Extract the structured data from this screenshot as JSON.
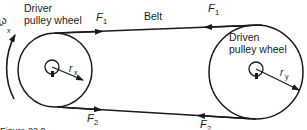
{
  "diagram": {
    "driver": {
      "label_line1": "Driver",
      "label_line2": "pulley wheel",
      "radius_label": "r",
      "radius_sub": "x",
      "omega_label": "ω",
      "omega_sub": "x"
    },
    "driven": {
      "label_line1": "Driven",
      "label_line2": "pulley wheel",
      "radius_label": "r",
      "radius_sub": "y"
    },
    "belt_label": "Belt",
    "forces": {
      "top_left": "F",
      "top_left_sub": "1",
      "top_right": "F",
      "top_right_sub": "1",
      "bottom_left": "F",
      "bottom_left_sub": "2",
      "bottom_right": "F",
      "bottom_right_sub": "2"
    },
    "caption": "Figure 22.9",
    "colors": {
      "ink": "#1a1a1a",
      "background": "#ffffff"
    }
  }
}
